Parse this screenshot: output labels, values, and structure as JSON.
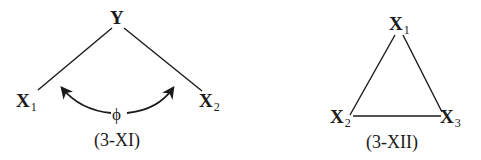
{
  "diagrams": [
    {
      "id": "3-XI",
      "caption": "(3-XI)",
      "nodes": [
        {
          "name": "Y",
          "base": "Y",
          "sub": ""
        },
        {
          "name": "X1",
          "base": "X",
          "sub": "1"
        },
        {
          "name": "X2",
          "base": "X",
          "sub": "2"
        }
      ],
      "edges": [
        [
          "Y",
          "X1"
        ],
        [
          "Y",
          "X2"
        ]
      ],
      "angle_label": "ϕ",
      "angle_arrows": [
        "toward Y-X1 edge",
        "toward Y-X2 edge"
      ]
    },
    {
      "id": "3-XII",
      "caption": "(3-XII)",
      "nodes": [
        {
          "name": "X1",
          "base": "X",
          "sub": "1"
        },
        {
          "name": "X2",
          "base": "X",
          "sub": "2"
        },
        {
          "name": "X3",
          "base": "X",
          "sub": "3"
        }
      ],
      "edges": [
        [
          "X1",
          "X2"
        ],
        [
          "X1",
          "X3"
        ],
        [
          "X2",
          "X3"
        ]
      ]
    }
  ],
  "colors": {
    "ink": "#1a1a1a",
    "background": "#ffffff"
  }
}
